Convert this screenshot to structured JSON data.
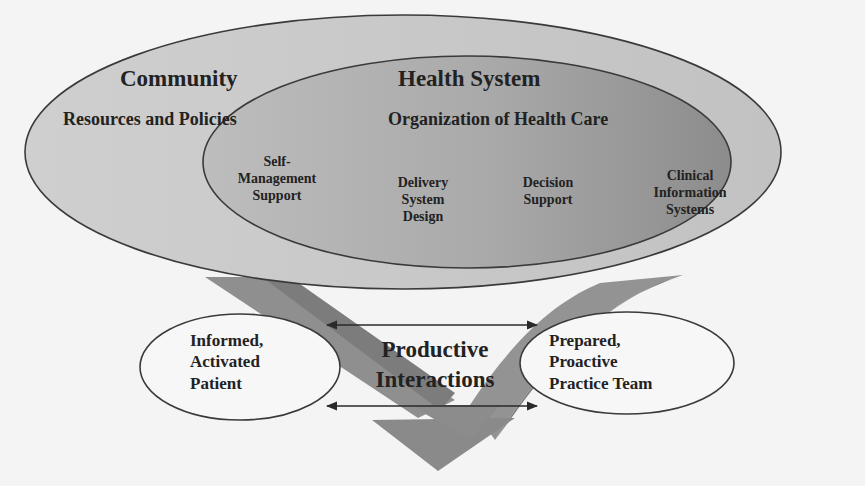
{
  "diagram": {
    "type": "chronic-care-model",
    "colors": {
      "background": "#f4f4f4",
      "outer_ellipse_fill": "#c9c9c9",
      "inner_ellipse_fill": "#a8a8a8",
      "inner_ellipse_fill_dark": "#8e8e8e",
      "arrow_fill": "#8f8f8f",
      "arrow_shade": "#7a7a7a",
      "outline": "#3a3a3a",
      "oval_fill": "#f7f7f7",
      "text": "#222222"
    },
    "community": {
      "title": "Community",
      "subtitle": "Resources and Policies"
    },
    "health_system": {
      "title": "Health System",
      "subtitle": "Organization of Health Care",
      "components": [
        {
          "line1": "Self-",
          "line2": "Management",
          "line3": "Support"
        },
        {
          "line1": "Delivery",
          "line2": "System",
          "line3": "Design"
        },
        {
          "line1": "Decision",
          "line2": "Support",
          "line3": ""
        },
        {
          "line1": "Clinical",
          "line2": "Information",
          "line3": "Systems"
        }
      ]
    },
    "patient": {
      "line1": "Informed,",
      "line2": "Activated",
      "line3": "Patient"
    },
    "interactions": {
      "line1": "Productive",
      "line2": "Interactions"
    },
    "team": {
      "line1": "Prepared,",
      "line2": "Proactive",
      "line3": "Practice Team"
    }
  }
}
